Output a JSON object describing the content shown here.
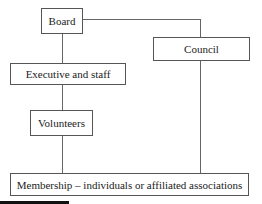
{
  "diagram": {
    "type": "organizational-structure",
    "nodes": {
      "board": "Board",
      "council": "Council",
      "executive": "Executive and staff",
      "volunteers": "Volunteers",
      "membership": "Membership – individuals or affiliated associations"
    },
    "edges": [
      [
        "Board",
        "Executive and staff"
      ],
      [
        "Executive and staff",
        "Volunteers"
      ],
      [
        "Volunteers",
        "Membership – individuals or affiliated associations"
      ],
      [
        "Board",
        "Council"
      ],
      [
        "Council",
        "Membership – individuals or affiliated associations"
      ]
    ]
  }
}
